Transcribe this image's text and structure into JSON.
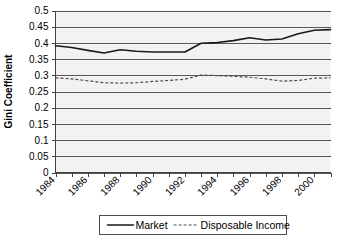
{
  "chart_data": {
    "type": "line",
    "title": "",
    "xlabel": "",
    "ylabel": "Gini Coefficient",
    "ylim": [
      0,
      0.5
    ],
    "ytick_step": 0.05,
    "yticks": [
      "0",
      "0.05",
      "0.1",
      "0.15",
      "0.2",
      "0.25",
      "0.3",
      "0.35",
      "0.4",
      "0.45",
      "0.5"
    ],
    "grid": true,
    "legend_position": "bottom",
    "x": [
      1984,
      1985,
      1986,
      1987,
      1988,
      1989,
      1990,
      1991,
      1992,
      1993,
      1994,
      1995,
      1996,
      1997,
      1998,
      1999,
      2000,
      2001
    ],
    "xtick_labels": [
      "1984",
      "1986",
      "1988",
      "1990",
      "1992",
      "1994",
      "1996",
      "1998",
      "2000"
    ],
    "xtick_label_years": [
      1984,
      1986,
      1988,
      1990,
      1992,
      1994,
      1996,
      1998,
      2000
    ],
    "xlim": [
      1984,
      2001
    ],
    "series": [
      {
        "name": "Market",
        "style": "solid",
        "color": "#1a1a1a",
        "values": [
          0.391,
          0.386,
          0.377,
          0.369,
          0.379,
          0.374,
          0.372,
          0.372,
          0.372,
          0.399,
          0.401,
          0.407,
          0.416,
          0.409,
          0.412,
          0.428,
          0.439,
          0.441
        ]
      },
      {
        "name": "Disposable Income",
        "style": "dashed",
        "color": "#4d4d4d",
        "values": [
          0.292,
          0.289,
          0.283,
          0.277,
          0.276,
          0.277,
          0.281,
          0.284,
          0.288,
          0.301,
          0.299,
          0.297,
          0.294,
          0.289,
          0.282,
          0.284,
          0.291,
          0.292
        ]
      }
    ]
  },
  "legend": {
    "entries": [
      {
        "label": "Market",
        "style": "solid"
      },
      {
        "label": "Disposable Income",
        "style": "dashed"
      }
    ]
  }
}
